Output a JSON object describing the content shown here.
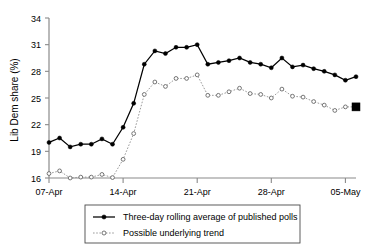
{
  "chart_data": {
    "type": "line",
    "title": "",
    "xlabel": "",
    "ylabel": "Lib Dem share (%)",
    "ylim": [
      16,
      34
    ],
    "yticks": [
      16,
      19,
      22,
      25,
      28,
      31,
      34
    ],
    "ytick_labels": [
      "16",
      "19",
      "22",
      "25",
      "28",
      "31",
      "34"
    ],
    "xticks": [
      "07-Apr",
      "14-Apr",
      "21-Apr",
      "28-Apr",
      "05-May"
    ],
    "xtick_labels": [
      "07-Apr",
      "14-Apr",
      "21-Apr",
      "28-Apr",
      "05-May"
    ],
    "xlim": [
      "07-Apr",
      "06-May"
    ],
    "grid": false,
    "legend_position": "below",
    "x": [
      "07-Apr",
      "08-Apr",
      "09-Apr",
      "10-Apr",
      "11-Apr",
      "12-Apr",
      "13-Apr",
      "14-Apr",
      "15-Apr",
      "16-Apr",
      "17-Apr",
      "18-Apr",
      "19-Apr",
      "20-Apr",
      "21-Apr",
      "22-Apr",
      "23-Apr",
      "24-Apr",
      "25-Apr",
      "26-Apr",
      "27-Apr",
      "28-Apr",
      "29-Apr",
      "30-Apr",
      "01-May",
      "02-May",
      "03-May",
      "04-May",
      "05-May",
      "06-May"
    ],
    "series": [
      {
        "name": "Three-day rolling average of published polls",
        "style": "solid",
        "marker": "filled-circle",
        "color": "#000000",
        "values": [
          20.0,
          20.5,
          19.5,
          19.8,
          19.8,
          20.4,
          19.8,
          21.7,
          24.4,
          28.8,
          30.3,
          30.0,
          30.7,
          30.7,
          31.0,
          28.8,
          29.0,
          29.2,
          29.5,
          29.0,
          28.8,
          28.4,
          29.5,
          28.5,
          28.7,
          28.3,
          28.0,
          27.6,
          27.0,
          27.4
        ]
      },
      {
        "name": "Possible underlying trend",
        "style": "dotted",
        "marker": "open-circle",
        "color": "#9a9a9a",
        "values": [
          16.5,
          16.8,
          16.0,
          16.1,
          16.1,
          16.4,
          16.05,
          18.1,
          21.0,
          25.4,
          26.8,
          26.3,
          27.2,
          27.2,
          27.6,
          25.3,
          25.3,
          25.7,
          26.1,
          25.5,
          25.4,
          25.0,
          26.0,
          25.2,
          25.1,
          24.6,
          24.2,
          23.6,
          24.0,
          24.0
        ]
      }
    ],
    "end_marker": {
      "name": "final-projection-marker",
      "shape": "filled-square",
      "x": "06-May",
      "value": 24.0,
      "color": "#000000"
    }
  },
  "legend": {
    "entries": [
      {
        "label": "Three-day rolling average of published polls",
        "marker": "filled-circle",
        "style": "solid"
      },
      {
        "label": "Possible underlying trend",
        "marker": "open-circle",
        "style": "dotted"
      }
    ]
  }
}
